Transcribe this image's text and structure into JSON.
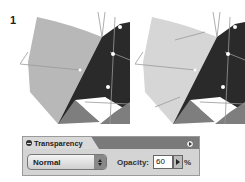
{
  "step_number": "1",
  "illustrations": [
    {
      "name": "before",
      "light_fill": "#b8b8b8",
      "dark_fill": "#2a2a2a",
      "mid_fill": "#7e7e7e"
    },
    {
      "name": "after",
      "light_fill": "#d6d6d6",
      "dark_fill": "#2a2a2a",
      "mid_fill": "#7e7e7e"
    }
  ],
  "panel": {
    "title": "Transparency",
    "blend_mode": "Normal",
    "opacity_label": "Opacity:",
    "opacity_value": "60",
    "percent_sign": "%"
  }
}
